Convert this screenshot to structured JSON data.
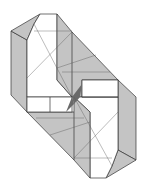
{
  "diagram": {
    "type": "origami-folding-diagram",
    "colors": {
      "paper_front": "#ffffff",
      "paper_back": "#c4c4c4",
      "lines": "#333333",
      "shadow": "#6a6a6a"
    }
  }
}
